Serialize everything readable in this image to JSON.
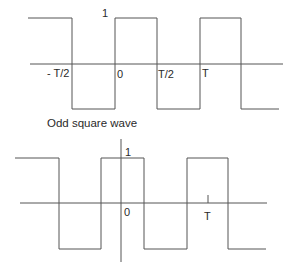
{
  "colors": {
    "line": "#555555",
    "text": "#2a2a2a",
    "background": "#ffffff"
  },
  "top_diagram": {
    "amplitude_label": "1",
    "tick_labels": {
      "neg_half_period": "- T/2",
      "zero": "0",
      "half_period": "T/2",
      "period": "T"
    },
    "caption": "Odd square wave"
  },
  "bottom_diagram": {
    "amplitude_label": "1",
    "tick_labels": {
      "zero": "0",
      "period": "T"
    }
  }
}
